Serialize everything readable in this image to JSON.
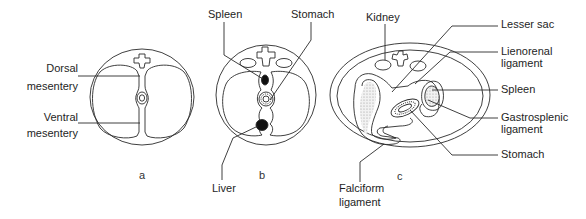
{
  "figure": {
    "panels": [
      {
        "id": "a",
        "letter": "a",
        "labels": [
          {
            "text": "Dorsal",
            "line2": "mesentery"
          },
          {
            "text": "Ventral",
            "line2": "mesentery"
          }
        ]
      },
      {
        "id": "b",
        "letter": "b",
        "labels": [
          {
            "text": "Spleen"
          },
          {
            "text": "Stomach"
          },
          {
            "text": "Liver"
          }
        ]
      },
      {
        "id": "c",
        "letter": "c",
        "labels": [
          {
            "text": "Kidney"
          },
          {
            "text": "Lesser sac"
          },
          {
            "text": "Lienorenal",
            "line2": "ligament"
          },
          {
            "text": "Spleen"
          },
          {
            "text": "Gastrosplenic",
            "line2": "ligament"
          },
          {
            "text": "Stomach"
          },
          {
            "text": "Falciform",
            "line2": "ligament"
          }
        ]
      }
    ]
  },
  "colors": {
    "line": "#2a2a2a",
    "fill_dark": "#111111",
    "fill_stipple": "#d9d9d9",
    "background": "#ffffff"
  }
}
